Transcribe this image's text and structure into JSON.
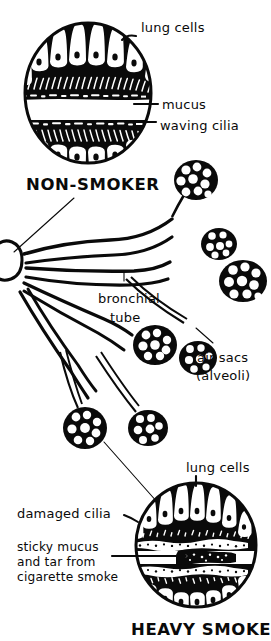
{
  "figure": {
    "style": "hand-drawn black and white line illustration",
    "background_color": "#ffffff",
    "ink_color": "#0a0a0a"
  },
  "panels": {
    "top": {
      "heading": "NON-SMOKER",
      "labels": [
        {
          "id": "lung-cells-top",
          "text": "lung cells"
        },
        {
          "id": "mucus",
          "text": "mucus"
        },
        {
          "id": "waving-cilia",
          "text": "waving cilia"
        }
      ]
    },
    "middle": {
      "labels": [
        {
          "id": "bronchial-tube",
          "line1": "bronchial",
          "line2": "tube"
        },
        {
          "id": "air-sacs",
          "line1": "air sacs",
          "line2": "(alveoli)"
        }
      ]
    },
    "bottom": {
      "heading": "HEAVY SMOKER",
      "labels": [
        {
          "id": "lung-cells-bottom",
          "text": "lung cells"
        },
        {
          "id": "damaged-cilia",
          "text": "damaged cilia"
        },
        {
          "id": "sticky-mucus",
          "line1": "sticky mucus",
          "line2": "and tar from",
          "line3": "cigarette smoke"
        }
      ]
    }
  }
}
